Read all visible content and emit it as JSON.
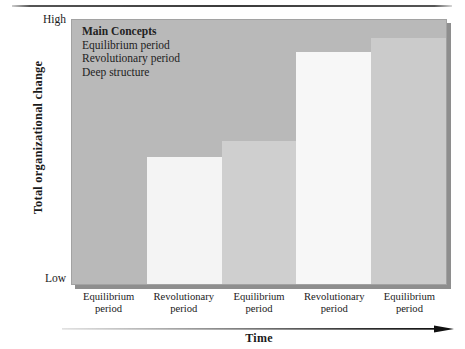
{
  "figure": {
    "divider": "horizontal-rule"
  },
  "chart_data": {
    "type": "bar",
    "title": "",
    "xlabel": "Time",
    "ylabel": "Total organizational change",
    "categories": [
      "Equilibrium period",
      "Revolutionary period",
      "Equilibrium period",
      "Revolutionary period",
      "Equilibrium period"
    ],
    "category_lines": [
      [
        "Equilibrium",
        "period"
      ],
      [
        "Revolutionary",
        "period"
      ],
      [
        "Equilibrium",
        "period"
      ],
      [
        "Revolutionary",
        "period"
      ],
      [
        "Equilibrium",
        "period"
      ]
    ],
    "values": [
      0,
      48,
      54,
      88,
      93
    ],
    "ylim": [
      0,
      100
    ],
    "ytick_labels": [
      "High",
      "Low"
    ],
    "grid": false,
    "legend": false,
    "series": [
      {
        "name": "Total organizational change",
        "values": [
          0,
          48,
          54,
          88,
          93
        ]
      }
    ],
    "bar_colors": [
      "#b9b9b9",
      "#f4f4f4",
      "#cfcfcf",
      "#f7f7f7",
      "#cbcbcb"
    ],
    "plot_background": "#b9b9b9",
    "annotations": {
      "heading": "Main Concepts",
      "lines": [
        "Equilibrium period",
        "Revolutionary period",
        "Deep structure"
      ]
    }
  },
  "axis": {
    "y_title": "Total organizational change",
    "y_high": "High",
    "y_low": "Low",
    "x_title": "Time"
  }
}
